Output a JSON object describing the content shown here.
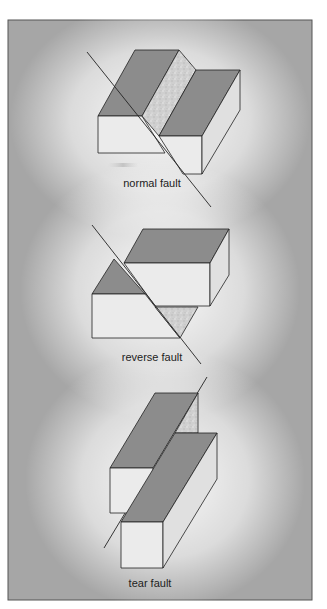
{
  "figure": {
    "background": {
      "edge_color": "#9a9a9a",
      "center_color": "#ffffff",
      "border_color": "#555555"
    },
    "colors": {
      "top_face": "#8c8c8c",
      "front_face": "#ebebeb",
      "side_face": "#e0e0e0",
      "fault_surface": "#cfcfcf",
      "outline": "#222222"
    },
    "panels": [
      {
        "id": "normal",
        "label": "normal fault"
      },
      {
        "id": "reverse",
        "label": "reverse fault"
      },
      {
        "id": "tear",
        "label": "tear fault"
      }
    ]
  }
}
